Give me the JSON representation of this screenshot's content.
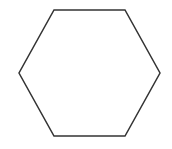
{
  "diagram": {
    "shape": "hexagon",
    "orientation": "flat-top",
    "stroke_color": "#333333",
    "fill_color": "#ffffff",
    "stroke_width": 1.5,
    "points": "54,10 125,10 160,73 125,136 54,136 19,73"
  }
}
